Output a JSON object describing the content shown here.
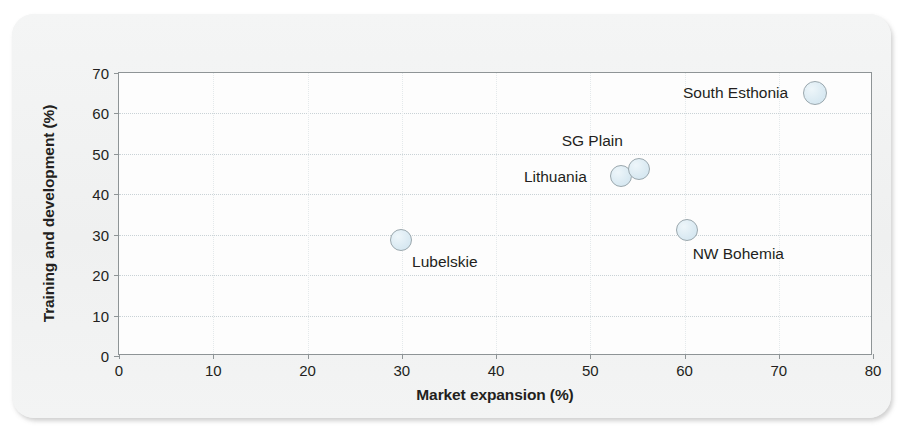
{
  "chart_data": {
    "type": "scatter",
    "title": "",
    "xlabel": "Market expansion  (%)",
    "ylabel": "Training and development (%)",
    "xlim": [
      0,
      80
    ],
    "ylim": [
      0,
      70
    ],
    "xticks": [
      "0",
      "10",
      "20",
      "30",
      "40",
      "50",
      "60",
      "70",
      "80"
    ],
    "yticks": [
      "0",
      "10",
      "20",
      "30",
      "40",
      "50",
      "60",
      "70"
    ],
    "grid": "horizontal-dotted",
    "legend": "none",
    "marker_style": "open-circle-pale-blue",
    "points": [
      {
        "label": "Lubelskie",
        "x": 29.9,
        "y": 28.6,
        "r": 11,
        "label_dx": 44,
        "label_dy": 22
      },
      {
        "label": "Lithuania",
        "x": 53.3,
        "y": 44.5,
        "r": 11,
        "label_dx": -66,
        "label_dy": 1
      },
      {
        "label": "SG Plain",
        "x": 55.2,
        "y": 46.3,
        "r": 11,
        "label_dx": -47,
        "label_dy": -28
      },
      {
        "label": "NW Bohemia",
        "x": 60.3,
        "y": 31.1,
        "r": 11,
        "label_dx": 51,
        "label_dy": 24
      },
      {
        "label": "South Esthonia",
        "x": 73.8,
        "y": 65.0,
        "r": 12,
        "label_dx": -79,
        "label_dy": 0
      }
    ]
  },
  "colors": {
    "card_background": "#f2f3f3",
    "plot_background": "#fdfdfd",
    "axis_line": "#8e9496",
    "gridline": "#c9d2d6",
    "marker_fill": "#dcebf3",
    "marker_stroke": "#9aa7ad",
    "text": "#231f20"
  }
}
